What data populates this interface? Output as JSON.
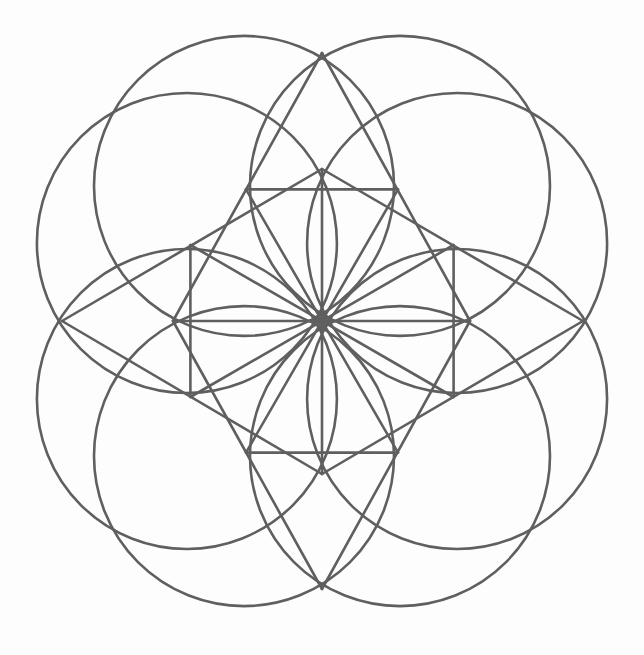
{
  "figure": {
    "title": "",
    "canvas": {
      "width": 644,
      "height": 655,
      "background": "#fdfdfd"
    },
    "stroke": {
      "color": "#5f5f5f",
      "width": 2.6
    },
    "center": [
      322,
      321
    ],
    "circles": [
      {
        "name": "circle-30",
        "cx": 457.1,
        "cy": 243.0,
        "r": 150
      },
      {
        "name": "circle-60",
        "cx": 400.0,
        "cy": 185.9,
        "r": 150
      },
      {
        "name": "circle-120",
        "cx": 244.0,
        "cy": 185.9,
        "r": 150
      },
      {
        "name": "circle-150",
        "cx": 186.9,
        "cy": 243.0,
        "r": 150
      },
      {
        "name": "circle-210",
        "cx": 186.9,
        "cy": 399.0,
        "r": 150
      },
      {
        "name": "circle-240",
        "cx": 244.0,
        "cy": 456.1,
        "r": 150
      },
      {
        "name": "circle-300",
        "cx": 400.0,
        "cy": 456.1,
        "r": 150
      },
      {
        "name": "circle-330",
        "cx": 457.1,
        "cy": 399.0,
        "r": 150
      }
    ],
    "points": {
      "outer": {
        "top": [
          322,
          53
        ],
        "right": [
          583,
          321
        ],
        "bottom": [
          322,
          589
        ],
        "left": [
          62,
          321
        ]
      },
      "inner": {
        "top": [
          322,
          169
        ],
        "right": [
          470,
          321
        ],
        "bottom": [
          322,
          474
        ],
        "left": [
          173,
          321
        ]
      },
      "corners": {
        "p30": [
          453.6,
          245.0
        ],
        "p60": [
          398.0,
          189.4
        ],
        "p120": [
          246.0,
          189.4
        ],
        "p150": [
          190.4,
          245.0
        ],
        "p210": [
          190.4,
          397.0
        ],
        "p240": [
          246.0,
          452.6
        ],
        "p300": [
          398.0,
          452.6
        ],
        "p330": [
          453.6,
          397.0
        ]
      }
    },
    "lines": [
      {
        "name": "axis-vertical",
        "from": [
          322,
          169
        ],
        "to": [
          322,
          474
        ]
      },
      {
        "name": "axis-horizontal",
        "from": [
          173,
          321
        ],
        "to": [
          470,
          321
        ]
      },
      {
        "name": "ray-30-210",
        "from": [
          453.6,
          245.0
        ],
        "to": [
          190.4,
          397.0
        ]
      },
      {
        "name": "ray-60-240",
        "from": [
          398.0,
          189.4
        ],
        "to": [
          246.0,
          452.6
        ]
      },
      {
        "name": "ray-120-300",
        "from": [
          246.0,
          189.4
        ],
        "to": [
          398.0,
          452.6
        ]
      },
      {
        "name": "ray-150-330",
        "from": [
          190.4,
          245.0
        ],
        "to": [
          453.6,
          397.0
        ]
      },
      {
        "name": "square-top",
        "from": [
          246.0,
          189.4
        ],
        "to": [
          398.0,
          189.4
        ]
      },
      {
        "name": "square-left",
        "from": [
          190.4,
          245.0
        ],
        "to": [
          190.4,
          397.0
        ]
      },
      {
        "name": "square-bottom",
        "from": [
          246.0,
          452.6
        ],
        "to": [
          398.0,
          452.6
        ]
      },
      {
        "name": "square-right",
        "from": [
          453.6,
          245.0
        ],
        "to": [
          453.6,
          397.0
        ]
      },
      {
        "name": "star-top-to-inner-left",
        "from": [
          322,
          53
        ],
        "to": [
          173,
          321
        ]
      },
      {
        "name": "star-top-to-inner-right",
        "from": [
          322,
          53
        ],
        "to": [
          470,
          321
        ]
      },
      {
        "name": "star-bottom-to-inner-left",
        "from": [
          322,
          589
        ],
        "to": [
          173,
          321
        ]
      },
      {
        "name": "star-bottom-to-inner-right",
        "from": [
          322,
          589
        ],
        "to": [
          470,
          321
        ]
      },
      {
        "name": "star-left-to-inner-top",
        "from": [
          62,
          321
        ],
        "to": [
          322,
          169
        ]
      },
      {
        "name": "star-left-to-inner-bottom",
        "from": [
          62,
          321
        ],
        "to": [
          322,
          474
        ]
      },
      {
        "name": "star-right-to-inner-top",
        "from": [
          583,
          321
        ],
        "to": [
          322,
          169
        ]
      },
      {
        "name": "star-right-to-inner-bottom",
        "from": [
          583,
          321
        ],
        "to": [
          322,
          474
        ]
      }
    ]
  }
}
